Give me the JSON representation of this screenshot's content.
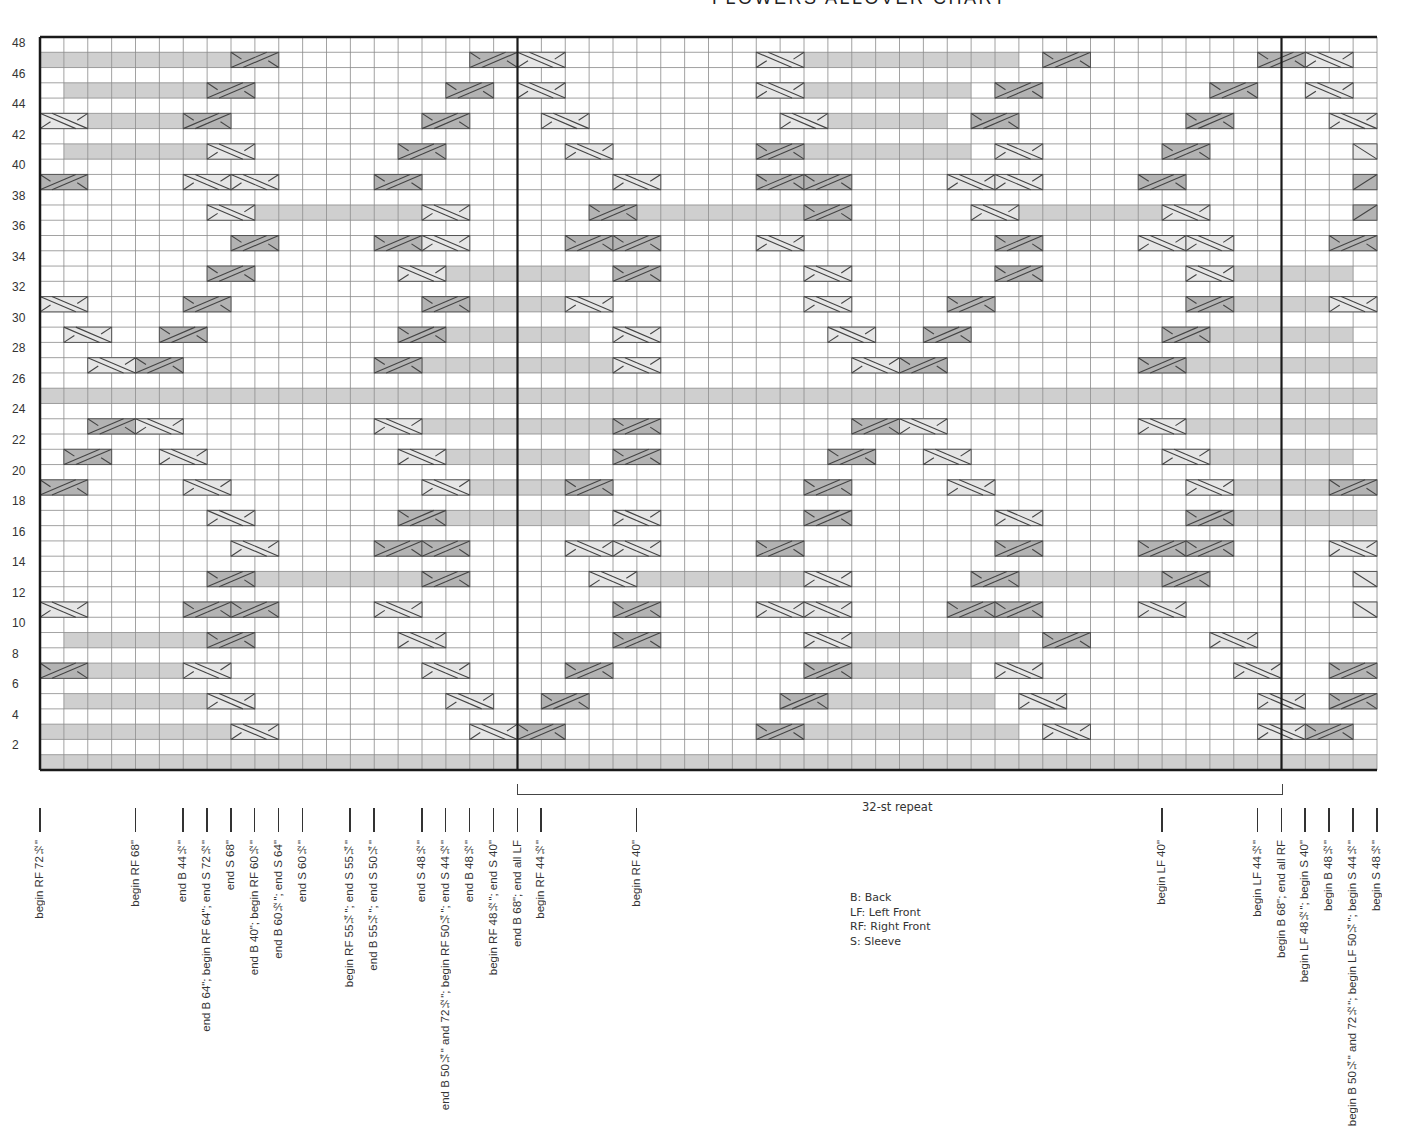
{
  "title": "FLOWERS ALLOVER CHART",
  "chart_data": {
    "type": "heatmap",
    "title": "FLOWERS ALLOVER CHART",
    "columns": 56,
    "rows_total": 48,
    "row_axis_labels": [
      48,
      46,
      44,
      42,
      40,
      38,
      36,
      34,
      32,
      30,
      28,
      26,
      24,
      22,
      20,
      18,
      16,
      14,
      12,
      10,
      8,
      6,
      4,
      2
    ],
    "repeat": {
      "label": "32-st repeat",
      "start_col": 20,
      "end_col": 52
    },
    "cell_colors": {
      "empty": "#ffffff",
      "shaded": "#cfcfcf",
      "light_cable": "#e6e6e6",
      "dark_cable": "#b3b3b3",
      "grid": "#8a8a8a",
      "border": "#1a1a1a"
    },
    "odd_rows": {
      "47": "ssssssssDd........DdLl........Llsssssssss.Dd.......DdLl..",
      "45": ".ssssssDd........Dd.Ll........Llsssssss.Dd.......Dd..Ll.",
      "43": "LlssssDd........Dd...Ll........Llsssss.Dd.......Dd....Ll",
      "41": ".ssssssLl......Dd.....Ll......Ddsssssss.Ll.....Dd......L",
      "39": "Dd....LlLl....Dd........Ll....DdDd....LlLl....Dd.......D",
      "37": ".......LlsssssssLl.....DdsssssssDd.....LlssssssLl......D",
      "35": "........Dd....DdLl....DdDd....Ll........Dd....LlLl....Dd",
      "33": ".......Dd......Llssssss.Dd......Ll......Dd......Llsssssl",
      "31": "Ll....Dd........DdssssLl........Ll....Dd........DdssssLl",
      "29": ".Ll..Dd........Ddssssss.Ll.......Ll..Dd........Ddssssssl",
      "27": "..LlDd........DdssssssssLl........LlDd........Ddssssssss",
      "25": "ssssssssssssssssssssssssssssssssssssssssssssssssssssssss",
      "23": "..DdLl........LlssssssssDd........DdLl........Llssssssss",
      "21": ".Dd..Ll........Llssssss.Dd.......Dd..Ll........Llssssssd",
      "19": "Dd....Ll........LlssssDd........Dd....Ll........LlssssDd",
      "17": ".......Ll......Ddssssss.Ll......Dd......Ll......Ddssssss",
      "15": "........Ll....DdDd....LlLl....Dd........Dd....DdDd....Ll",
      "13": ".......DdsssssssDd.....LlsssssssLl.....DdssssssDd......L",
      "11": "Ll....DdDd....Ll........Dd....LlLl....DdDd....Ll.......L",
      "9": ".ssssssDd......Ll.......Dd......Llsssssss.Dd.....Ll.....D",
      "7": "DdssssLl........Ll....Dd........Ddsssss.Ll........Ll..Dd",
      "5": ".ssssssLl........Ll..Dd........Ddsssssss.Ll........Ll.Dd.",
      "3": "ssssssssLl........LlDd........Ddsssssssss.Ll.......LlDd..",
      "1": "ssssssssssssssssssssssssssssssssssssssssssssssssssssssss"
    },
    "size_markers": [
      {
        "col": 0,
        "label": "begin RF 72½\""
      },
      {
        "col": 4,
        "label": "begin RF 68\""
      },
      {
        "col": 6,
        "label": "end B 44½\""
      },
      {
        "col": 7,
        "label": "end B 64\"; begin RF 64\"; end S 72½\""
      },
      {
        "col": 8,
        "label": "end S 68\""
      },
      {
        "col": 9,
        "label": "end B 40\"; begin RF 60½\""
      },
      {
        "col": 10,
        "label": "end B 60½\"; end S 64\""
      },
      {
        "col": 11,
        "label": "end S 60½\""
      },
      {
        "col": 13,
        "label": "begin RF 55¼\"; end S 55¼\""
      },
      {
        "col": 14,
        "label": "end B 55¼\"; end S 50¼\""
      },
      {
        "col": 16,
        "label": "end S 48½\""
      },
      {
        "col": 17,
        "label": "end B 50¼\" and 72½\"; begin RF 50¼\"; end S 44½\""
      },
      {
        "col": 18,
        "label": "end B 48½\""
      },
      {
        "col": 19,
        "label": "begin RF 48½\"; end S 40\""
      },
      {
        "col": 20,
        "label": "end B 68\"; end all LF"
      },
      {
        "col": 21,
        "label": "begin RF 44½\""
      },
      {
        "col": 25,
        "label": "begin RF 40\""
      },
      {
        "col": 47,
        "label": "begin LF 40\""
      },
      {
        "col": 51,
        "label": "begin LF 44½\""
      },
      {
        "col": 52,
        "label": "begin B 68\"; end all RF"
      },
      {
        "col": 53,
        "label": "begin LF 48½\"; begin S 40\""
      },
      {
        "col": 54,
        "label": "begin B 48½\""
      },
      {
        "col": 55,
        "label": "begin B 50¼\" and 72½\"; begin LF 50¼\"; begin S 44½\""
      },
      {
        "col": 56,
        "label": "begin S 48½\""
      }
    ],
    "legend": [
      "B: Back",
      "LF: Left Front",
      "RF: Right Front",
      "S: Sleeve"
    ]
  },
  "repeat_label": "32-st repeat",
  "legend": {
    "b": "B: Back",
    "lf": "LF: Left Front",
    "rf": "RF: Right Front",
    "s": "S: Sleeve"
  }
}
